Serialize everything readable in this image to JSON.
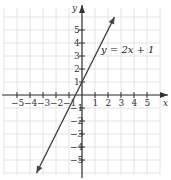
{
  "chart_data": {
    "type": "line",
    "title": "",
    "equation_label": "y = 2x + 1",
    "xlabel": "x",
    "ylabel": "y",
    "xlim": [
      -6,
      6
    ],
    "ylim": [
      -6,
      6
    ],
    "grid": true,
    "x_ticks": [
      "-5",
      "-4",
      "-3",
      "-2",
      "-1",
      "1",
      "2",
      "3",
      "4",
      "5"
    ],
    "y_ticks": [
      "5",
      "4",
      "3",
      "2",
      "1",
      "-1",
      "-2",
      "-3",
      "-4",
      "-5"
    ],
    "series": [
      {
        "name": "y = 2x + 1",
        "slope": 2,
        "intercept": 1,
        "x": [
          -3.5,
          2.5
        ],
        "y": [
          -6,
          6
        ]
      }
    ]
  }
}
